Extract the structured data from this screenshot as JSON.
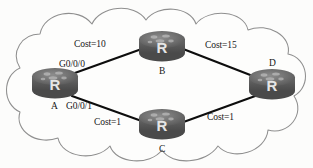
{
  "diagram": {
    "background_color": "#fcfcfb",
    "cloud": {
      "name": "network-cloud",
      "stroke_color": "#8c8c8c",
      "fill_color": "#fdfdfc"
    },
    "link_color": "#0d0d0d",
    "router_icon": {
      "glyph": "R",
      "body_color": "#5f5f5f",
      "top_color": "#7b7b7b",
      "glyph_color": "#e8e8e8"
    },
    "routers": [
      {
        "id": "A",
        "label": "A",
        "x": 55,
        "y": 85,
        "label_position": "below-left"
      },
      {
        "id": "B",
        "label": "B",
        "x": 162,
        "y": 48,
        "label_position": "below"
      },
      {
        "id": "C",
        "label": "C",
        "x": 162,
        "y": 126,
        "label_position": "below"
      },
      {
        "id": "D",
        "label": "D",
        "x": 272,
        "y": 86,
        "label_position": "above"
      }
    ],
    "interfaces": [
      {
        "name": "G0/0/0",
        "router": "A",
        "x": 59,
        "y": 60
      },
      {
        "name": "G0/0/1",
        "router": "A",
        "x": 66,
        "y": 101
      }
    ],
    "links": [
      {
        "from": "A",
        "to": "B",
        "cost_label": "Cost=10",
        "label_x": 74,
        "label_y": 39
      },
      {
        "from": "B",
        "to": "D",
        "cost_label": "Cost=15",
        "label_x": 205,
        "label_y": 40
      },
      {
        "from": "A",
        "to": "C",
        "cost_label": "Cost=1",
        "label_x": 94,
        "label_y": 117
      },
      {
        "from": "C",
        "to": "D",
        "cost_label": "Cost=1",
        "label_x": 207,
        "label_y": 112
      }
    ]
  }
}
